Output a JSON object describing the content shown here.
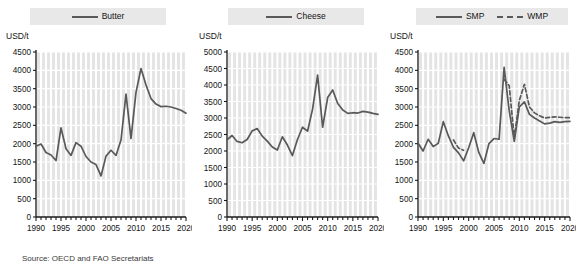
{
  "figure": {
    "source_note": "Source: OECD and FAO Secretariats",
    "axis_unit": "USD/t",
    "line_color": "#595959",
    "plot_bg_color": "#e4e4e4",
    "gridline_color": "#ffffff",
    "legend_bg_color": "#e8e8e8"
  },
  "chart_data": [
    {
      "type": "line",
      "title": "Butter",
      "xlabel": "",
      "ylabel": "USD/t",
      "ylim": [
        0,
        4500
      ],
      "yticks": [
        0,
        500,
        1000,
        1500,
        2000,
        2500,
        3000,
        3500,
        4000,
        4500
      ],
      "xlim": [
        1990,
        2020
      ],
      "xticks": [
        1990,
        1995,
        2000,
        2005,
        2010,
        2015,
        2020
      ],
      "grid": true,
      "legend_position": "top-center",
      "x": [
        1990,
        1991,
        1992,
        1993,
        1994,
        1995,
        1996,
        1997,
        1998,
        1999,
        2000,
        2001,
        2002,
        2003,
        2004,
        2005,
        2006,
        2007,
        2008,
        2009,
        2010,
        2011,
        2012,
        2013,
        2014,
        2015,
        2016,
        2017,
        2018,
        2019,
        2020
      ],
      "series": [
        {
          "name": "Butter",
          "style": "solid",
          "values": [
            1930,
            1990,
            1760,
            1690,
            1540,
            2430,
            1860,
            1680,
            2030,
            1930,
            1650,
            1500,
            1430,
            1120,
            1660,
            1820,
            1680,
            2100,
            3350,
            2140,
            3400,
            4050,
            3600,
            3230,
            3080,
            3010,
            3020,
            3000,
            2960,
            2910,
            2830
          ]
        }
      ]
    },
    {
      "type": "line",
      "title": "Cheese",
      "xlabel": "",
      "ylabel": "USD/t",
      "ylim": [
        0,
        5000
      ],
      "yticks": [
        0,
        500,
        1000,
        1500,
        2000,
        2500,
        3000,
        3500,
        4000,
        4500,
        5000
      ],
      "xlim": [
        1990,
        2020
      ],
      "xticks": [
        1990,
        1995,
        2000,
        2005,
        2010,
        2015,
        2020
      ],
      "grid": true,
      "legend_position": "top-center",
      "x": [
        1990,
        1991,
        1992,
        1993,
        1994,
        1995,
        1996,
        1997,
        1998,
        1999,
        2000,
        2001,
        2002,
        2003,
        2004,
        2005,
        2006,
        2007,
        2008,
        2009,
        2010,
        2011,
        2012,
        2013,
        2014,
        2015,
        2016,
        2017,
        2018,
        2019,
        2020
      ],
      "series": [
        {
          "name": "Cheese",
          "style": "solid",
          "values": [
            2340,
            2470,
            2290,
            2250,
            2350,
            2610,
            2680,
            2450,
            2300,
            2120,
            2030,
            2430,
            2180,
            1860,
            2350,
            2720,
            2600,
            3270,
            4300,
            2720,
            3620,
            3850,
            3440,
            3240,
            3140,
            3160,
            3150,
            3200,
            3180,
            3140,
            3110
          ]
        }
      ]
    },
    {
      "type": "line",
      "title": "Milk powders",
      "xlabel": "",
      "ylabel": "USD/t",
      "ylim": [
        0,
        4500
      ],
      "yticks": [
        0,
        500,
        1000,
        1500,
        2000,
        2500,
        3000,
        3500,
        4000,
        4500
      ],
      "xlim": [
        1990,
        2020
      ],
      "xticks": [
        1990,
        1995,
        2000,
        2005,
        2010,
        2015,
        2020
      ],
      "grid": true,
      "legend_position": "top-center",
      "x": [
        1990,
        1991,
        1992,
        1993,
        1994,
        1995,
        1996,
        1997,
        1998,
        1999,
        2000,
        2001,
        2002,
        2003,
        2004,
        2005,
        2006,
        2007,
        2008,
        2009,
        2010,
        2011,
        2012,
        2013,
        2014,
        2015,
        2016,
        2017,
        2018,
        2019,
        2020
      ],
      "series": [
        {
          "name": "SMP",
          "style": "solid",
          "values": [
            2020,
            1800,
            2120,
            1920,
            2010,
            2600,
            2210,
            1900,
            1750,
            1530,
            1890,
            2300,
            1760,
            1460,
            2000,
            2140,
            2120,
            4080,
            2900,
            2060,
            3000,
            3140,
            2800,
            2700,
            2620,
            2540,
            2560,
            2600,
            2580,
            2600,
            2610
          ]
        },
        {
          "name": "WMP",
          "style": "dashed",
          "values": [
            null,
            null,
            null,
            null,
            null,
            null,
            null,
            2100,
            1880,
            1820,
            null,
            null,
            null,
            null,
            null,
            null,
            null,
            3750,
            3580,
            2160,
            3180,
            3620,
            3000,
            2840,
            2760,
            2700,
            2720,
            2730,
            2720,
            2710,
            2710
          ]
        }
      ]
    }
  ]
}
